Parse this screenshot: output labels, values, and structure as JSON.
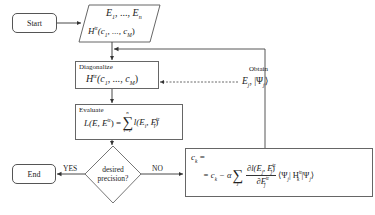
{
  "diagram": {
    "type": "flowchart",
    "nodes": {
      "start": {
        "label": "Start"
      },
      "input": {
        "line1": "E",
        "line1_sub1": "1",
        "line1_mid": ", ..., ",
        "line1_sub2": "n",
        "line1_tail": "E",
        "line2_H": "H",
        "line2_sup": "tr",
        "line2_args": "(c",
        "line2_sub1": "1",
        "line2_mid": ", ..., c",
        "line2_subM": "M",
        "line2_close": ")"
      },
      "diagonalize": {
        "title": "Diagonalize",
        "H": "H",
        "sup": "tr",
        "args": "(c",
        "sub1": "1",
        "mid": ", ..., c",
        "subM": "M",
        "close": ")"
      },
      "obtain": {
        "title": "Obtain",
        "E": "E",
        "sub_j": "j",
        "psi": ", |Ψ",
        "psi_sub": "j",
        "close": "⟩"
      },
      "evaluate": {
        "title": "Evaluate",
        "lhs": "L(E, E",
        "lhs_sup": "tr",
        "lhs_close": ") = ",
        "sum_top": "n",
        "sum_sym": "∑",
        "sum_bottom": "i=1",
        "rhs": "l(E",
        "rhs_sub": "i",
        "rhs_mid": ", E",
        "rhs_sup": "tr",
        "rhs_sub2": "i",
        "rhs_close": ")"
      },
      "decision": {
        "line1": "desired",
        "line2": "precision?"
      },
      "end": {
        "label": "End"
      },
      "update": {
        "line1": "c",
        "line1_sub": "k",
        "line1_eq": " =",
        "line2_prefix": "= c",
        "line2_sub": "k",
        "line2_minus": " − α",
        "sum_sym": "∑",
        "sum_bottom": "j",
        "frac_num": "∂l(E",
        "frac_num_sub": "j",
        "frac_num_mid": ", E",
        "frac_num_sup": "tr",
        "frac_num_sub2": "j",
        "frac_num_close": ")",
        "frac_den": "∂E",
        "frac_den_sup": "tr",
        "frac_den_sub": "j",
        "bra": "⟨Ψ",
        "bra_sub": "j",
        "op": "| H",
        "op_sup": "tr",
        "op_sub": "k",
        "ket": " |Ψ",
        "ket_sub": "j",
        "ket_close": "⟩"
      }
    },
    "edges": {
      "yes_label": "YES",
      "no_label": "NO"
    },
    "colors": {
      "stroke": "#555555",
      "text": "#222222",
      "background": "#ffffff"
    }
  }
}
